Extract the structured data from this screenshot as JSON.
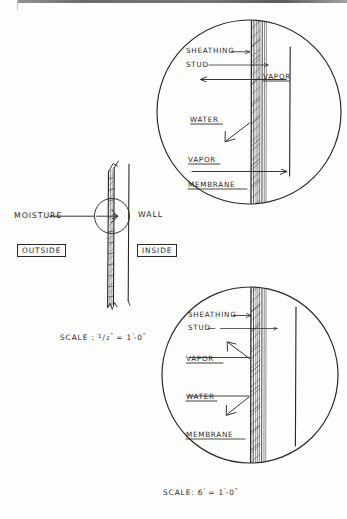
{
  "drawing": {
    "title": "Wall Moisture / Vapor Detail",
    "ink_color": "#2b2a29",
    "paper_color": "#fdfdfc"
  },
  "elevation": {
    "moisture_label": "MOISTURE",
    "wall_label": "WALL",
    "outside_label": "OUTSIDE",
    "inside_label": "INSIDE",
    "scale_note": "SCALE :",
    "scale_value_num": "1",
    "scale_value_den": "2",
    "scale_value_unit": "\"",
    "scale_equals": "=",
    "scale_target_feet": "1",
    "scale_target_feet_mark": "'",
    "scale_target_dash": "-",
    "scale_target_inches": "0",
    "scale_target_inch_mark": "\"",
    "scale_full_text": "SCALE : 1/2\" = 1'-0\""
  },
  "detail_top": {
    "labels": [
      {
        "id": "sheathing",
        "text": "SHEATHING"
      },
      {
        "id": "stud",
        "text": "STUD"
      },
      {
        "id": "vapor_upper",
        "text": "VAPOR"
      },
      {
        "id": "water",
        "text": "WATER"
      },
      {
        "id": "vapor_lower",
        "text": "VAPOR"
      },
      {
        "id": "membrane",
        "text": "MEMBRANE"
      }
    ]
  },
  "detail_bottom": {
    "labels": [
      {
        "id": "sheathing",
        "text": "SHEATHING"
      },
      {
        "id": "stud",
        "text": "STUD"
      },
      {
        "id": "vapor",
        "text": "VAPOR"
      },
      {
        "id": "water",
        "text": "WATER"
      },
      {
        "id": "membrane",
        "text": "MEMBRANE"
      }
    ],
    "scale_note": "SCALE:",
    "scale_value": "6",
    "scale_value_mark": "'",
    "scale_equals": "=",
    "scale_target_feet": "1",
    "scale_target_feet_mark": "'",
    "scale_target_dash": "-",
    "scale_target_inches": "0",
    "scale_target_inch_mark": "\"",
    "scale_full_text": "SCALE: 6' = 1'-0\""
  }
}
